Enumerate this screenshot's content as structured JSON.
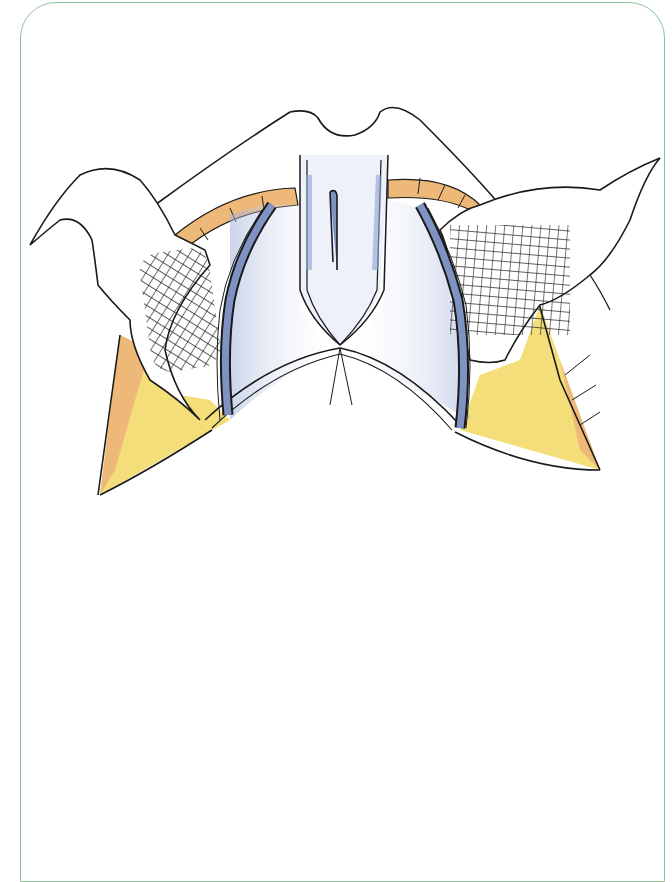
{
  "figure": {
    "kind": "surgical-illustration",
    "caption": "",
    "frame_color": "#8fc49a",
    "palette": {
      "outline": "#1a1a1a",
      "skin_flap": "#ffffff",
      "muscle_orange": "#eeb878",
      "fat_yellow": "#f3de7a",
      "vessel_blue": "#7f93c2",
      "shadow_blue": "#b9c6e4",
      "mesh": "#222222"
    },
    "elements": [
      {
        "name": "left-skin-flap"
      },
      {
        "name": "right-skin-flap"
      },
      {
        "name": "central-structure"
      },
      {
        "name": "left-mesh"
      },
      {
        "name": "right-mesh"
      },
      {
        "name": "left-vessel"
      },
      {
        "name": "right-vessel"
      },
      {
        "name": "left-fat-pad"
      },
      {
        "name": "right-fat-pad"
      }
    ]
  }
}
